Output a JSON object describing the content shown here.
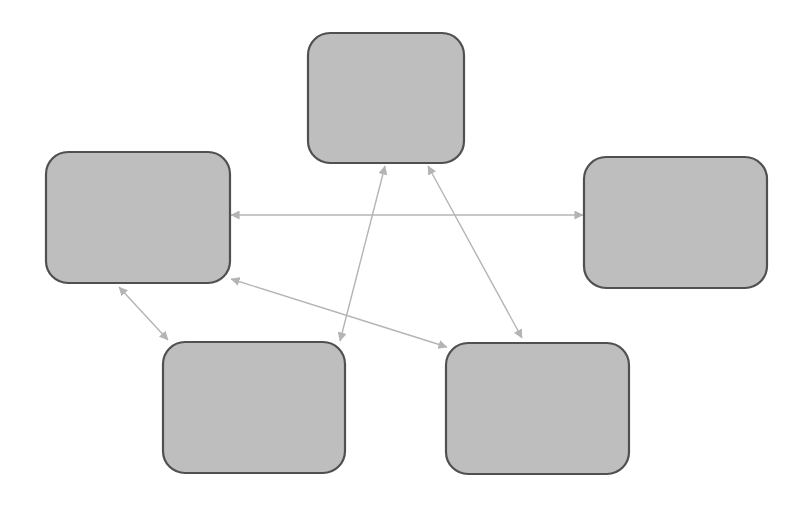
{
  "diagram": {
    "type": "network",
    "title": "",
    "colors": {
      "node_fill": "#bebebe",
      "node_stroke": "#505050",
      "edge": "#b4b4b4",
      "background": "#ffffff"
    },
    "nodes": [
      {
        "id": "top",
        "label": ""
      },
      {
        "id": "left",
        "label": ""
      },
      {
        "id": "right",
        "label": ""
      },
      {
        "id": "bottom-left",
        "label": ""
      },
      {
        "id": "bottom-right",
        "label": ""
      }
    ],
    "edges": [
      {
        "from": "left",
        "to": "right",
        "direction": "both"
      },
      {
        "from": "top",
        "to": "bottom-left",
        "direction": "both"
      },
      {
        "from": "top",
        "to": "bottom-right",
        "direction": "both"
      },
      {
        "from": "left",
        "to": "bottom-left",
        "direction": "both"
      },
      {
        "from": "left",
        "to": "bottom-right",
        "direction": "both"
      }
    ]
  }
}
